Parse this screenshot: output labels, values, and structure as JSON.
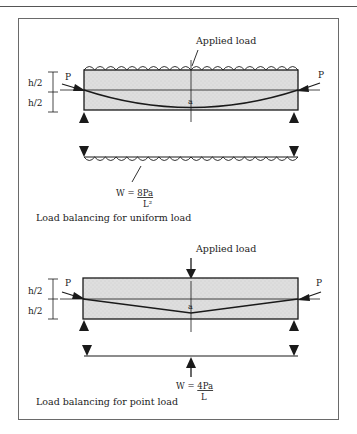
{
  "header": {
    "text": "Prestressed concrete"
  },
  "figure": {
    "panels": [
      {
        "id": "uniform",
        "applied_load_label": "Applied load",
        "prestress_left_label": "P",
        "prestress_right_label": "P",
        "half_depth_top_label": "h/2",
        "half_depth_bottom_label": "h/2",
        "sag_label": "a",
        "equivalent_load_prefix": "W = ",
        "equivalent_load_numerator": "8Pa",
        "equivalent_load_denominator": "L²",
        "caption": "Load balancing for uniform load",
        "tendon_profile": "parabolic"
      },
      {
        "id": "point",
        "applied_load_label": "Applied load",
        "prestress_left_label": "P",
        "prestress_right_label": "P",
        "half_depth_top_label": "h/2",
        "half_depth_bottom_label": "h/2",
        "sag_label": "a",
        "equivalent_load_prefix": "W = ",
        "equivalent_load_numerator": "4Pa",
        "equivalent_load_denominator": "L",
        "caption": "Load balancing for point load",
        "tendon_profile": "harped"
      }
    ],
    "colors": {
      "beam_fill": "#dcdcdc",
      "line": "#1a1a1a",
      "frame": "#6a6a6a"
    }
  }
}
